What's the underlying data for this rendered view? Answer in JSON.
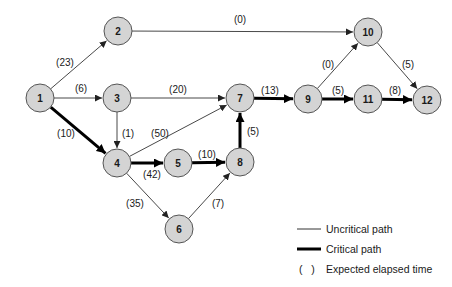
{
  "diagram": {
    "type": "pert-network",
    "node_radius": 14,
    "colors": {
      "node_fill": "#d4d4d4",
      "node_stroke": "#555555",
      "uncritical_edge": "#333333",
      "critical_edge": "#000000"
    },
    "nodes": [
      {
        "id": "1",
        "label": "1",
        "x": 40,
        "y": 98
      },
      {
        "id": "2",
        "label": "2",
        "x": 118,
        "y": 31
      },
      {
        "id": "3",
        "label": "3",
        "x": 117,
        "y": 98
      },
      {
        "id": "4",
        "label": "4",
        "x": 117,
        "y": 163
      },
      {
        "id": "5",
        "label": "5",
        "x": 178,
        "y": 163
      },
      {
        "id": "6",
        "label": "6",
        "x": 179,
        "y": 229
      },
      {
        "id": "7",
        "label": "7",
        "x": 240,
        "y": 98
      },
      {
        "id": "8",
        "label": "8",
        "x": 240,
        "y": 162
      },
      {
        "id": "9",
        "label": "9",
        "x": 308,
        "y": 99
      },
      {
        "id": "10",
        "label": "10",
        "x": 368,
        "y": 32
      },
      {
        "id": "11",
        "label": "11",
        "x": 368,
        "y": 99
      },
      {
        "id": "12",
        "label": "12",
        "x": 427,
        "y": 100
      }
    ],
    "edges": [
      {
        "from": "1",
        "to": "2",
        "label": "(23)",
        "critical": false,
        "lx": 65,
        "ly": 62
      },
      {
        "from": "1",
        "to": "3",
        "label": "(6)",
        "critical": false,
        "lx": 81,
        "ly": 88
      },
      {
        "from": "1",
        "to": "4",
        "label": "(10)",
        "critical": true,
        "lx": 66,
        "ly": 133
      },
      {
        "from": "2",
        "to": "10",
        "label": "(0)",
        "critical": false,
        "lx": 240,
        "ly": 19
      },
      {
        "from": "3",
        "to": "7",
        "label": "(20)",
        "critical": false,
        "lx": 178,
        "ly": 89
      },
      {
        "from": "3",
        "to": "4",
        "label": "(1)",
        "critical": false,
        "lx": 128,
        "ly": 133
      },
      {
        "from": "4",
        "to": "7",
        "label": "(50)",
        "critical": false,
        "lx": 160,
        "ly": 133
      },
      {
        "from": "4",
        "to": "5",
        "label": "(42)",
        "critical": true,
        "lx": 152,
        "ly": 174
      },
      {
        "from": "4",
        "to": "6",
        "label": "(35)",
        "critical": false,
        "lx": 135,
        "ly": 203
      },
      {
        "from": "5",
        "to": "8",
        "label": "(10)",
        "critical": true,
        "lx": 207,
        "ly": 154
      },
      {
        "from": "6",
        "to": "8",
        "label": "(7)",
        "critical": false,
        "lx": 218,
        "ly": 203
      },
      {
        "from": "8",
        "to": "7",
        "label": "(5)",
        "critical": true,
        "lx": 253,
        "ly": 131
      },
      {
        "from": "7",
        "to": "9",
        "label": "(13)",
        "critical": true,
        "lx": 270,
        "ly": 90
      },
      {
        "from": "9",
        "to": "10",
        "label": "(0)",
        "critical": false,
        "lx": 328,
        "ly": 64
      },
      {
        "from": "9",
        "to": "11",
        "label": "(5)",
        "critical": true,
        "lx": 338,
        "ly": 90
      },
      {
        "from": "10",
        "to": "12",
        "label": "(5)",
        "critical": false,
        "lx": 408,
        "ly": 64
      },
      {
        "from": "11",
        "to": "12",
        "label": "(8)",
        "critical": true,
        "lx": 395,
        "ly": 90
      }
    ]
  },
  "legend": {
    "items": [
      {
        "symbol": "thin-line",
        "label": "Uncritical path",
        "y": 229
      },
      {
        "symbol": "thick-line",
        "label": "Critical path",
        "y": 249
      },
      {
        "symbol": "parentheses",
        "symbol_text": "(   )",
        "label": "Expected elapsed time",
        "y": 269
      }
    ]
  }
}
